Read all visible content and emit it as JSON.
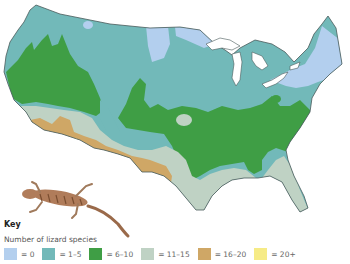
{
  "map": {
    "title": "Number of lizard species across the contiguous United States",
    "region": "United States (contiguous)",
    "illustration": "lizard"
  },
  "key": {
    "title": "Key",
    "subtitle": "Number of lizard species",
    "items": [
      {
        "label": "= 0",
        "color": "#b3cfee"
      },
      {
        "label": "= 1–5",
        "color": "#72b9b9"
      },
      {
        "label": "= 6–10",
        "color": "#3f9e45"
      },
      {
        "label": "= 11–15",
        "color": "#bfd2c4"
      },
      {
        "label": "= 16–20",
        "color": "#cfa766"
      },
      {
        "label": "= 20+",
        "color": "#f6eb86"
      }
    ]
  },
  "colors": {
    "zero": "#b3cfee",
    "one_five": "#72b9b9",
    "six_ten": "#3f9e45",
    "eleven_fifteen": "#bfd2c4",
    "sixteen_twenty": "#cfa766",
    "twenty_plus": "#f6eb86",
    "border": "#4a5a5a",
    "water": "#ffffff"
  }
}
